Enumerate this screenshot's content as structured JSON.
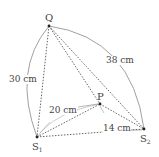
{
  "diagram": {
    "points": {
      "Q": {
        "label": "Q",
        "x": 49,
        "y": 26
      },
      "S1": {
        "label": "S",
        "sub": "1",
        "x": 37,
        "y": 137
      },
      "S2": {
        "label": "S",
        "sub": "2",
        "x": 144,
        "y": 129
      },
      "P": {
        "label": "P",
        "x": 100,
        "y": 104
      }
    },
    "measurements": {
      "Q_S1": "30 cm",
      "Q_S2": "38 cm",
      "S1_P": "20 cm",
      "P_S2": "14 cm"
    },
    "colors": {
      "line": "#555555",
      "arc": "#777777",
      "dot": "#222222",
      "text": "#444444"
    }
  }
}
